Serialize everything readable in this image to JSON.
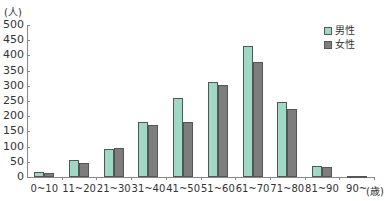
{
  "chart_data": {
    "type": "bar",
    "title": "",
    "xlabel": "(歳)",
    "ylabel": "(人)",
    "ylim": [
      0,
      500
    ],
    "yticks": [
      0,
      50,
      100,
      150,
      200,
      250,
      300,
      350,
      400,
      450,
      500
    ],
    "grid": false,
    "legend_position": "top-right",
    "categories": [
      "0~10",
      "11~20",
      "21~30",
      "31~40",
      "41~50",
      "51~60",
      "61~70",
      "71~80",
      "81~90",
      "90~"
    ],
    "series": [
      {
        "name": "男性",
        "color": "#9fd9c6",
        "values": [
          17,
          57,
          93,
          180,
          260,
          313,
          430,
          247,
          37,
          2
        ]
      },
      {
        "name": "女性",
        "color": "#7d7d7d",
        "values": [
          12,
          47,
          97,
          172,
          182,
          303,
          377,
          223,
          33,
          1
        ]
      }
    ]
  },
  "labels": {
    "y_unit": "(人)",
    "x_unit": "(歳)",
    "legend_male": "男性",
    "legend_female": "女性"
  }
}
